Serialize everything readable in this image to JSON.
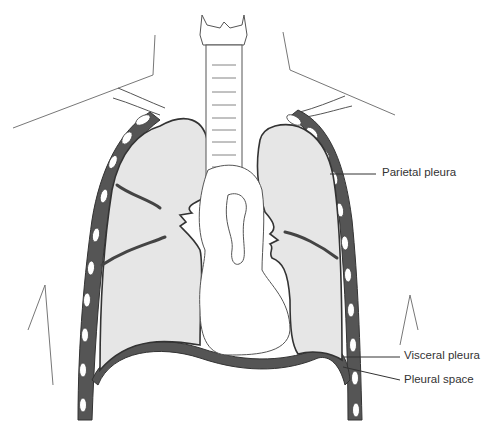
{
  "diagram": {
    "labels": [
      {
        "id": "parietal",
        "text": "Parietal pleura"
      },
      {
        "id": "visceral",
        "text": "Visceral pleura"
      },
      {
        "id": "space",
        "text": "Pleural space"
      }
    ],
    "colors": {
      "lung_fill": "#e6e6e6",
      "pleura_dark": "#555555",
      "outline": "#3a3a3a",
      "rib": "#ffffff",
      "label_text": "#333333"
    }
  }
}
